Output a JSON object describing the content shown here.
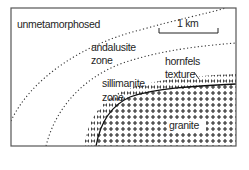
{
  "diagram": {
    "type": "contact-metamorphism-map",
    "labels": {
      "unmetamorphosed": "unmetamorphosed",
      "andalusite_line1": "andalusite",
      "andalusite_line2": "zone",
      "sillimanite_line1": "sillimanite",
      "sillimanite_line2": "zone",
      "hornfels_line1": "hornfels",
      "hornfels_line2": "texture",
      "granite": "granite"
    },
    "scale_bar": {
      "label": "1 km"
    },
    "colors": {
      "frame": "#555555",
      "ink": "#1e1e1e",
      "background": "#ffffff"
    },
    "zones": [
      {
        "name": "unmetamorphosed"
      },
      {
        "name": "andalusite zone"
      },
      {
        "name": "sillimanite zone"
      },
      {
        "name": "hornfels texture"
      },
      {
        "name": "granite"
      }
    ]
  }
}
